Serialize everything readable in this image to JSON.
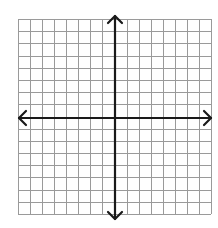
{
  "diagram": {
    "type": "coordinate-plane",
    "grid": {
      "columns": 16,
      "rows": 16,
      "left": 18,
      "top": 19,
      "right": 211,
      "bottom": 214,
      "line_color": "#9a9a9a"
    },
    "axes": {
      "color": "#1a1a1a",
      "x_axis": {
        "y": 118,
        "x_start": 19,
        "x_end": 211,
        "arrows": [
          "left",
          "right"
        ]
      },
      "y_axis": {
        "x": 115,
        "y_start": 16,
        "y_end": 219,
        "arrows": [
          "up",
          "down"
        ]
      }
    },
    "labels": []
  }
}
